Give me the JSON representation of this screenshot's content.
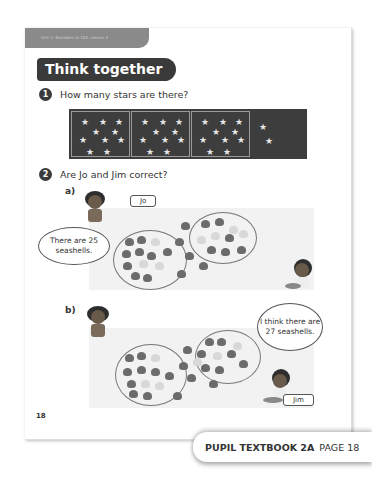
{
  "header": {
    "unit_label": "Unit 1: Numbers to 100, Lesson 3",
    "title": "Think together"
  },
  "questions": [
    {
      "number": "1",
      "text": "How many stars are there?",
      "groups_of_ten": 3,
      "extra_stars": 2
    },
    {
      "number": "2",
      "text": "Are Jo and Jim correct?",
      "parts": [
        {
          "label": "a)",
          "name_tag": "Jo",
          "speech": "There are 25 seashells."
        },
        {
          "label": "b)",
          "name_tag": "Jim",
          "speech": "I think there are 27 seashells."
        }
      ]
    }
  ],
  "footer": {
    "page_number": "18",
    "badge_book": "PUPIL TEXTBOOK 2A",
    "badge_page": "PAGE 18"
  },
  "colors": {
    "dark": "#3a3a3a",
    "shell_dark": "#6b6b6b",
    "shell_light": "#d8d8d8"
  }
}
